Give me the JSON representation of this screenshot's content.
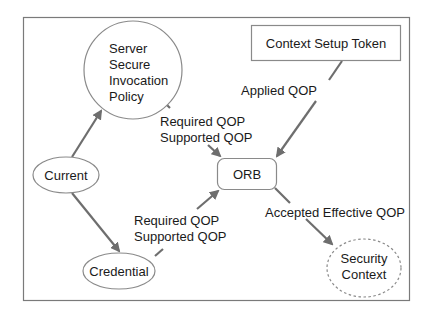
{
  "diagram": {
    "nodes": {
      "server_policy": {
        "lines": [
          "Server",
          "Secure",
          "Invocation",
          "Policy"
        ],
        "shape": "circle"
      },
      "context_setup_token": {
        "label": "Context Setup Token",
        "shape": "rectangle"
      },
      "orb": {
        "label": "ORB",
        "shape": "rounded-rectangle"
      },
      "current": {
        "label": "Current",
        "shape": "ellipse"
      },
      "credential": {
        "label": "Credential",
        "shape": "ellipse"
      },
      "security_context": {
        "lines": [
          "Security",
          "Context"
        ],
        "shape": "dashed-ellipse"
      }
    },
    "edges": {
      "server_to_orb": {
        "lines": [
          "Required QOP",
          "Supported QOP"
        ]
      },
      "token_to_orb": {
        "label": "Applied QOP"
      },
      "credential_to_orb": {
        "lines": [
          "Required QOP",
          "Supported QOP"
        ]
      },
      "orb_to_context": {
        "label": "Accepted Effective QOP"
      }
    },
    "colors": {
      "frame": "#7a7a7a",
      "node_stroke": "#8a8a8a",
      "arrow": "#6e6e6e",
      "text": "#1a1a1a"
    }
  }
}
